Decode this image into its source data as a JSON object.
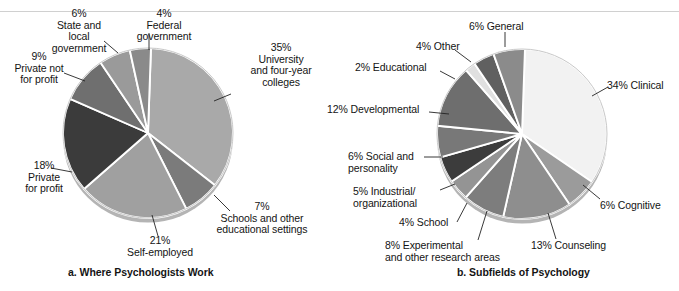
{
  "figure": {
    "divider_color": "#d0d0d0",
    "background": "#ffffff"
  },
  "panels": [
    {
      "id": "a",
      "caption": "a. Where Psychologists Work",
      "caption_pos": {
        "x": 68,
        "y": 266
      },
      "center": {
        "x": 148,
        "y": 133
      },
      "radius": 85,
      "start_angle": -88,
      "labels": [
        {
          "name": "state-local-government",
          "text": "6%\nState and\nlocal\ngovernment",
          "align": "c",
          "x": 31,
          "y": 8,
          "w": 96,
          "leader": [
            [
              118,
              53
            ],
            [
              104,
              41
            ]
          ]
        },
        {
          "name": "federal-government",
          "text": "4%\nFederal\ngovernment",
          "align": "c",
          "x": 119,
          "y": 8,
          "w": 90,
          "leader": [
            [
              149,
              50
            ],
            [
              149,
              33
            ]
          ]
        },
        {
          "name": "private-not-for-profit",
          "text": "9%\nPrivate not\nfor profit",
          "align": "c",
          "x": 2,
          "y": 51,
          "w": 74,
          "leader": [
            [
              85,
              81
            ],
            [
              64,
              73
            ]
          ]
        },
        {
          "name": "private-for-profit",
          "text": "18%\nPrivate\nfor profit",
          "align": "c",
          "x": 9,
          "y": 160,
          "w": 70,
          "leader": [
            [
              72,
              172
            ],
            [
              51,
              168
            ]
          ]
        },
        {
          "name": "self-employed",
          "text": "21%\nSelf-employed",
          "align": "c",
          "x": 107,
          "y": 235,
          "w": 106,
          "leader": [
            [
              152,
              215
            ],
            [
              158,
              236
            ]
          ]
        },
        {
          "name": "schools-and-other-educational-settings",
          "text": "7%\nSchools and other\neducational settings",
          "align": "c",
          "x": 197,
          "y": 201,
          "w": 130,
          "leader": [
            [
              214,
              195
            ],
            [
              230,
              211
            ]
          ]
        },
        {
          "name": "university-and-four-year-colleges",
          "text": "35%\nUniversity\nand four-year\ncolleges",
          "align": "c",
          "x": 230,
          "y": 42,
          "w": 102,
          "leader": [
            [
              214,
              101
            ],
            [
              231,
              94
            ]
          ]
        }
      ],
      "chart_data": {
        "type": "pie",
        "title": "a. Where Psychologists Work",
        "labels": [
          "University and four-year colleges",
          "Schools and other educational settings",
          "Self-employed",
          "Private for profit",
          "Private not for profit",
          "State and local government",
          "Federal government"
        ],
        "values": [
          35,
          7,
          21,
          18,
          9,
          6,
          4
        ],
        "units": "percent",
        "colors": [
          "#a9a9a9",
          "#7b7b7b",
          "#a0a0a0",
          "#3b3b3b",
          "#6f6f6f",
          "#9a9a9a",
          "#8a8a8a"
        ],
        "legend": "none"
      }
    },
    {
      "id": "b",
      "caption": "b. Subfields of Psychology",
      "caption_pos": {
        "x": 457,
        "y": 266
      },
      "center": {
        "x": 522,
        "y": 134
      },
      "radius": 85,
      "start_angle": -88,
      "labels": [
        {
          "name": "general",
          "text": "6% General",
          "align": "l",
          "x": 469,
          "y": 21,
          "w": 80,
          "leader": [
            [
              505,
              47
            ],
            [
              505,
              32
            ]
          ]
        },
        {
          "name": "other",
          "text": "4% Other",
          "align": "l",
          "x": 416,
          "y": 41,
          "w": 70,
          "leader": [
            [
              471,
              62
            ],
            [
              455,
              50
            ]
          ]
        },
        {
          "name": "educational",
          "text": "2% Educational",
          "align": "l",
          "x": 355,
          "y": 62,
          "w": 100,
          "leader": [
            [
              455,
              79
            ],
            [
              440,
              71
            ]
          ]
        },
        {
          "name": "developmental",
          "text": "12% Developmental",
          "align": "l",
          "x": 327,
          "y": 104,
          "w": 124,
          "leader": [
            [
              449,
              114
            ],
            [
              429,
              112
            ]
          ]
        },
        {
          "name": "social-and-personality",
          "text": "6% Social and\npersonality",
          "align": "l",
          "x": 348,
          "y": 151,
          "w": 104,
          "leader": [
            [
              443,
              157
            ],
            [
              424,
              157
            ]
          ]
        },
        {
          "name": "industrial-organizational",
          "text": "5% Industrial/\norganizational",
          "align": "l",
          "x": 353,
          "y": 186,
          "w": 102,
          "leader": [
            [
              455,
              184
            ],
            [
              440,
              190
            ]
          ]
        },
        {
          "name": "school",
          "text": "4% School",
          "align": "l",
          "x": 399,
          "y": 217,
          "w": 78,
          "leader": [
            [
              467,
              203
            ],
            [
              457,
              222
            ]
          ]
        },
        {
          "name": "experimental",
          "text": "8% Experimental\nand other research areas",
          "align": "l",
          "x": 385,
          "y": 240,
          "w": 150,
          "leader": [
            [
              487,
              211
            ],
            [
              478,
              240
            ]
          ]
        },
        {
          "name": "counseling",
          "text": "13% Counseling",
          "align": "l",
          "x": 531,
          "y": 240,
          "w": 104,
          "leader": [
            [
              548,
              213
            ],
            [
              556,
              239
            ]
          ]
        },
        {
          "name": "cognitive",
          "text": "6% Cognitive",
          "align": "l",
          "x": 600,
          "y": 200,
          "w": 86,
          "leader": [
            [
              583,
              185
            ],
            [
              600,
              199
            ]
          ]
        },
        {
          "name": "clinical",
          "text": "34% Clinical",
          "align": "l",
          "x": 607,
          "y": 80,
          "w": 86,
          "leader": [
            [
              592,
              96
            ],
            [
              608,
              87
            ]
          ]
        }
      ],
      "chart_data": {
        "type": "pie",
        "title": "b. Subfields of Psychology",
        "labels": [
          "Clinical",
          "Cognitive",
          "Counseling",
          "Experimental and other research areas",
          "School",
          "Industrial/organizational",
          "Social and personality",
          "Developmental",
          "Educational",
          "Other",
          "General"
        ],
        "values": [
          34,
          6,
          13,
          8,
          4,
          5,
          6,
          12,
          2,
          4,
          6
        ],
        "units": "percent",
        "colors": [
          "#f2f2f2",
          "#9b9b9b",
          "#8e8e8e",
          "#7d7d7d",
          "#949494",
          "#3c3c3c",
          "#787878",
          "#6e6e6e",
          "#e0e0e0",
          "#606060",
          "#8b8b8b"
        ],
        "legend": "none"
      }
    }
  ]
}
